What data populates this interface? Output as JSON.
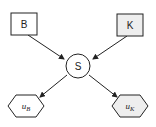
{
  "diagram": {
    "type": "bayesian-network",
    "nodes": [
      {
        "id": "B",
        "label": "B",
        "shape": "rectangle",
        "fill": "#ffffff"
      },
      {
        "id": "K",
        "label": "K",
        "shape": "rectangle",
        "fill": "#eeeeee"
      },
      {
        "id": "S",
        "label": "S",
        "shape": "circle",
        "fill": "#ffffff"
      },
      {
        "id": "uB",
        "label": "u",
        "subscript": "B",
        "shape": "hexagon",
        "fill": "#ffffff"
      },
      {
        "id": "uK",
        "label": "u",
        "subscript": "K",
        "shape": "hexagon",
        "fill": "#eeeeee"
      }
    ],
    "edges": [
      {
        "from": "B",
        "to": "S"
      },
      {
        "from": "K",
        "to": "S"
      },
      {
        "from": "S",
        "to": "uB"
      },
      {
        "from": "S",
        "to": "uK"
      }
    ],
    "colors": {
      "stroke": "#222222",
      "shaded": "#eeeeee",
      "background": "#ffffff"
    }
  }
}
